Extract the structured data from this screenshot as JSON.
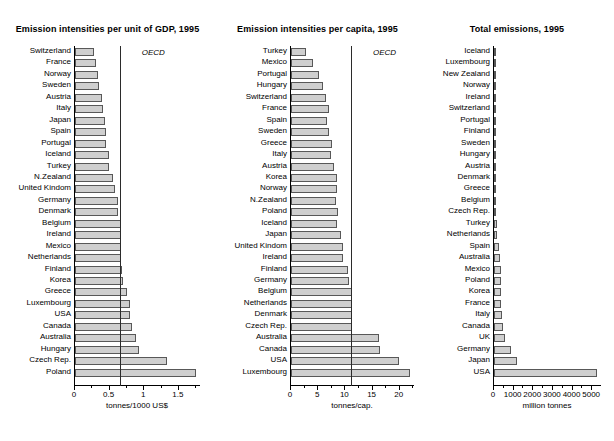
{
  "chart_data": [
    {
      "type": "bar",
      "orientation": "horizontal",
      "title": "Emission intensities per unit of GDP, 1995",
      "xlabel": "tonnes/1000 US$",
      "ylabel": "",
      "xlim": [
        0,
        1.82
      ],
      "xticks": [
        0,
        0.5,
        1,
        1.5
      ],
      "xtick_labels": [
        "0",
        "0.5",
        "1",
        "1.5"
      ],
      "grid": false,
      "reference_line": {
        "label": "OECD",
        "value": 0.66
      },
      "categories": [
        "Switzerland",
        "France",
        "Norway",
        "Sweden",
        "Austria",
        "Italy",
        "Japan",
        "Spain",
        "Portugal",
        "Iceland",
        "Turkey",
        "N.Zealand",
        "United Kindom",
        "Germany",
        "Denmark",
        "Belgium",
        "Ireland",
        "Mexico",
        "Netherlands",
        "Finland",
        "Korea",
        "Greece",
        "Luxembourg",
        "USA",
        "Canada",
        "Australia",
        "Hungary",
        "Czech Rep.",
        "Poland"
      ],
      "values": [
        0.27,
        0.3,
        0.33,
        0.34,
        0.39,
        0.4,
        0.44,
        0.45,
        0.45,
        0.49,
        0.49,
        0.55,
        0.58,
        0.62,
        0.62,
        0.66,
        0.66,
        0.67,
        0.67,
        0.68,
        0.69,
        0.75,
        0.8,
        0.8,
        0.83,
        0.88,
        0.92,
        1.33,
        1.75
      ]
    },
    {
      "type": "bar",
      "orientation": "horizontal",
      "title": "Emission intensities per capita, 1995",
      "xlabel": "tonnes/cap.",
      "ylabel": "",
      "xlim": [
        0,
        22.8
      ],
      "xticks": [
        0,
        5,
        10,
        15,
        20
      ],
      "xtick_labels": [
        "0",
        "5",
        "10",
        "15",
        "20"
      ],
      "grid": false,
      "reference_line": {
        "label": "OECD",
        "value": 11.2
      },
      "categories": [
        "Turkey",
        "Mexico",
        "Portugal",
        "Hungary",
        "Switzerland",
        "France",
        "Spain",
        "Sweden",
        "Greece",
        "Italy",
        "Austria",
        "Korea",
        "Norway",
        "N.Zealand",
        "Poland",
        "Iceland",
        "Japan",
        "United Kindom",
        "Ireland",
        "Finland",
        "Germany",
        "Belgium",
        "Netherlands",
        "Denmark",
        "Czech Rep.",
        "Australia",
        "Canada",
        "USA",
        "Luxembourg"
      ],
      "values": [
        2.7,
        4.0,
        5.1,
        5.8,
        6.5,
        6.9,
        6.6,
        7.0,
        7.6,
        7.4,
        7.9,
        8.5,
        8.4,
        8.3,
        8.6,
        8.5,
        9.2,
        9.6,
        9.5,
        10.5,
        10.6,
        11.3,
        11.3,
        11.3,
        11.3,
        16.1,
        16.3,
        19.9,
        21.8
      ]
    },
    {
      "type": "bar",
      "orientation": "horizontal",
      "title": "Total emissions, 1995",
      "xlabel": "million tonnes",
      "ylabel": "",
      "xlim": [
        0,
        5500
      ],
      "xticks": [
        0,
        1000,
        2000,
        3000,
        4000,
        5000
      ],
      "xtick_labels": [
        "0",
        "1000",
        "2000",
        "3000",
        "4000",
        "5000"
      ],
      "grid": false,
      "categories": [
        "Iceland",
        "Luxembourg",
        "New Zealand",
        "Norway",
        "Ireland",
        "Switzerland",
        "Portugal",
        "Finland",
        "Sweden",
        "Hungary",
        "Austria",
        "Denmark",
        "Greece",
        "Belgium",
        "Czech Rep.",
        "Turkey",
        "Netherlands",
        "Spain",
        "Australia",
        "Mexico",
        "Poland",
        "Korea",
        "France",
        "Italy",
        "Canada",
        "UK",
        "Germany",
        "Japan",
        "USA"
      ],
      "values": [
        2,
        9,
        30,
        36,
        35,
        47,
        51,
        54,
        62,
        59,
        64,
        59,
        80,
        115,
        117,
        160,
        175,
        230,
        290,
        350,
        355,
        375,
        380,
        425,
        470,
        565,
        890,
        1180,
        5230
      ]
    }
  ]
}
